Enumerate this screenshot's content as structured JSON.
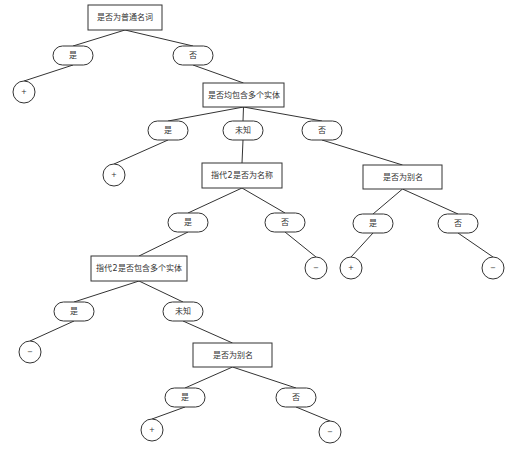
{
  "diagram": {
    "type": "decision-tree",
    "colors": {
      "stroke": "#333333",
      "fill": "#ffffff",
      "text": "#333333",
      "background": "#ffffff"
    },
    "nodes": [
      {
        "id": "n1",
        "kind": "decision",
        "label": "是否为普通名词",
        "x": 88,
        "y": 5,
        "w": 74,
        "h": 25
      },
      {
        "id": "b1",
        "kind": "branch",
        "label": "是",
        "x": 53,
        "y": 46,
        "w": 40,
        "h": 19
      },
      {
        "id": "b2",
        "kind": "branch",
        "label": "否",
        "x": 173,
        "y": 46,
        "w": 40,
        "h": 19
      },
      {
        "id": "l1",
        "kind": "leaf",
        "label": "+",
        "cx": 24,
        "cy": 92,
        "r": 11
      },
      {
        "id": "n2",
        "kind": "decision",
        "label": "是否均包含多个实体",
        "x": 203,
        "y": 83,
        "w": 81,
        "h": 24
      },
      {
        "id": "b3",
        "kind": "branch",
        "label": "是",
        "x": 148,
        "y": 121,
        "w": 40,
        "h": 19
      },
      {
        "id": "b4",
        "kind": "branch",
        "label": "未知",
        "x": 223,
        "y": 121,
        "w": 40,
        "h": 19
      },
      {
        "id": "b5",
        "kind": "branch",
        "label": "否",
        "x": 302,
        "y": 121,
        "w": 40,
        "h": 19
      },
      {
        "id": "l2",
        "kind": "leaf",
        "label": "+",
        "cx": 114,
        "cy": 175,
        "r": 11
      },
      {
        "id": "n3",
        "kind": "decision",
        "label": "指代2是否为名称",
        "x": 202,
        "y": 163,
        "w": 80,
        "h": 25
      },
      {
        "id": "n4",
        "kind": "decision",
        "label": "是否为别名",
        "x": 363,
        "y": 165,
        "w": 79,
        "h": 24
      },
      {
        "id": "b6",
        "kind": "branch",
        "label": "是",
        "x": 168,
        "y": 213,
        "w": 40,
        "h": 19
      },
      {
        "id": "b7",
        "kind": "branch",
        "label": "否",
        "x": 265,
        "y": 213,
        "w": 40,
        "h": 19
      },
      {
        "id": "b8",
        "kind": "branch",
        "label": "是",
        "x": 353,
        "y": 214,
        "w": 40,
        "h": 19
      },
      {
        "id": "b9",
        "kind": "branch",
        "label": "否",
        "x": 438,
        "y": 214,
        "w": 40,
        "h": 19
      },
      {
        "id": "l3",
        "kind": "leaf",
        "label": "−",
        "cx": 316,
        "cy": 268,
        "r": 11
      },
      {
        "id": "l4",
        "kind": "leaf",
        "label": "+",
        "cx": 351,
        "cy": 268,
        "r": 11
      },
      {
        "id": "l5",
        "kind": "leaf",
        "label": "−",
        "cx": 493,
        "cy": 268,
        "r": 11
      },
      {
        "id": "n5",
        "kind": "decision",
        "label": "指代2是否包含多个实体",
        "x": 91,
        "y": 256,
        "w": 96,
        "h": 25
      },
      {
        "id": "b10",
        "kind": "branch",
        "label": "是",
        "x": 54,
        "y": 302,
        "w": 40,
        "h": 19
      },
      {
        "id": "b11",
        "kind": "branch",
        "label": "未知",
        "x": 163,
        "y": 302,
        "w": 40,
        "h": 19
      },
      {
        "id": "l6",
        "kind": "leaf",
        "label": "−",
        "cx": 30,
        "cy": 352,
        "r": 11
      },
      {
        "id": "n6",
        "kind": "decision",
        "label": "是否为别名",
        "x": 193,
        "y": 343,
        "w": 79,
        "h": 24
      },
      {
        "id": "b12",
        "kind": "branch",
        "label": "是",
        "x": 165,
        "y": 388,
        "w": 40,
        "h": 19
      },
      {
        "id": "b13",
        "kind": "branch",
        "label": "否",
        "x": 276,
        "y": 388,
        "w": 40,
        "h": 19
      },
      {
        "id": "l7",
        "kind": "leaf",
        "label": "+",
        "cx": 152,
        "cy": 430,
        "r": 11
      },
      {
        "id": "l8",
        "kind": "leaf",
        "label": "−",
        "cx": 330,
        "cy": 432,
        "r": 11
      }
    ],
    "edges": [
      [
        "n1",
        "b1"
      ],
      [
        "n1",
        "b2"
      ],
      [
        "b1",
        "l1"
      ],
      [
        "b2",
        "n2"
      ],
      [
        "n2",
        "b3"
      ],
      [
        "n2",
        "b4"
      ],
      [
        "n2",
        "b5"
      ],
      [
        "b3",
        "l2"
      ],
      [
        "b4",
        "n3"
      ],
      [
        "b5",
        "n4"
      ],
      [
        "n3",
        "b6"
      ],
      [
        "n3",
        "b7"
      ],
      [
        "n4",
        "b8"
      ],
      [
        "n4",
        "b9"
      ],
      [
        "b7",
        "l3"
      ],
      [
        "b8",
        "l4"
      ],
      [
        "b9",
        "l5"
      ],
      [
        "b6",
        "n5"
      ],
      [
        "n5",
        "b10"
      ],
      [
        "n5",
        "b11"
      ],
      [
        "b10",
        "l6"
      ],
      [
        "b11",
        "n6"
      ],
      [
        "n6",
        "b12"
      ],
      [
        "n6",
        "b13"
      ],
      [
        "b12",
        "l7"
      ],
      [
        "b13",
        "l8"
      ]
    ]
  }
}
